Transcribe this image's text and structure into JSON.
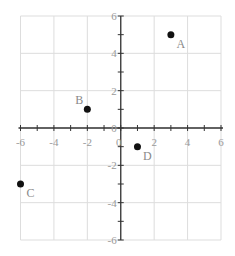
{
  "chart_data": {
    "type": "scatter",
    "title": "",
    "xlabel": "",
    "ylabel": "",
    "xlim": [
      -6,
      6
    ],
    "ylim": [
      -6,
      6
    ],
    "grid": true,
    "x_ticks": [
      -6,
      -4,
      -2,
      0,
      2,
      4,
      6
    ],
    "y_ticks": [
      -6,
      -4,
      -2,
      0,
      2,
      4,
      6
    ],
    "x_tick_labels": [
      "-6",
      "-4",
      "-2",
      "0",
      "2",
      "4",
      "6"
    ],
    "y_tick_labels": [
      "-6",
      "-4",
      "-2",
      "0",
      "2",
      "4",
      "6"
    ],
    "points": [
      {
        "label": "A",
        "x": 3,
        "y": 5
      },
      {
        "label": "B",
        "x": -2,
        "y": 1
      },
      {
        "label": "C",
        "x": -6,
        "y": -3
      },
      {
        "label": "D",
        "x": 1,
        "y": -1
      }
    ]
  }
}
